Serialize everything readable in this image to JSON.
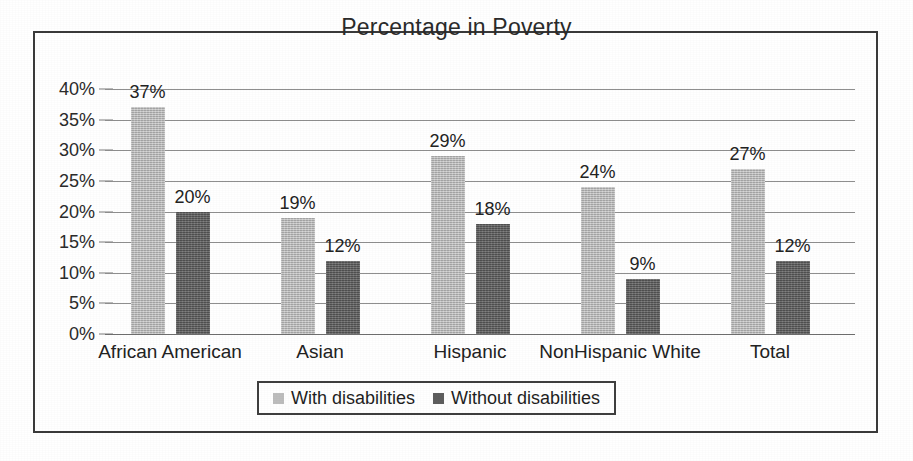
{
  "chart_data": {
    "type": "bar",
    "title": "Percentage in Poverty",
    "xlabel": "",
    "ylabel": "",
    "ylim": [
      0,
      40
    ],
    "grid": true,
    "legend_position": "bottom",
    "categories": [
      "African American",
      "Asian",
      "Hispanic",
      "NonHispanic White",
      "Total"
    ],
    "series": [
      {
        "name": "With disabilities",
        "color": "#b5b5b5",
        "values": [
          37,
          19,
          29,
          24,
          27
        ],
        "labels": [
          "37%",
          "19%",
          "29%",
          "24%",
          "27%"
        ]
      },
      {
        "name": "Without disabilities",
        "color": "#5e5e5e",
        "values": [
          20,
          12,
          18,
          9,
          12
        ],
        "labels": [
          "20%",
          "12%",
          "18%",
          "9%",
          "12%"
        ]
      }
    ],
    "yticks": [
      0,
      5,
      10,
      15,
      20,
      25,
      30,
      35,
      40
    ],
    "ytick_labels": [
      "0%",
      "5%",
      "10%",
      "15%",
      "20%",
      "25%",
      "30%",
      "35%",
      "40%"
    ]
  },
  "legend": {
    "items": [
      {
        "label": "With disabilities",
        "swatch": "light"
      },
      {
        "label": "Without disabilities",
        "swatch": "dark"
      }
    ]
  }
}
